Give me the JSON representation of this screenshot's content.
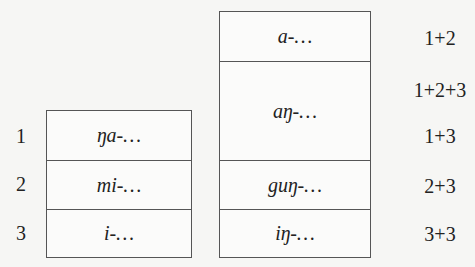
{
  "left_table": {
    "rows": [
      {
        "number": "1",
        "form": "ŋa-…"
      },
      {
        "number": "2",
        "form": "mi-…"
      },
      {
        "number": "3",
        "form": "i-…"
      }
    ]
  },
  "right_table": {
    "rows": [
      {
        "form": "a-…"
      },
      {
        "form": "aŋ-…"
      },
      {
        "form": "guŋ-…"
      },
      {
        "form": "iŋ-…"
      }
    ],
    "labels": [
      "1+2",
      "1+2+3",
      "1+3",
      "2+3",
      "3+3"
    ]
  },
  "colors": {
    "line": "#555555",
    "background": "#f6f6f4",
    "text": "#222222"
  }
}
